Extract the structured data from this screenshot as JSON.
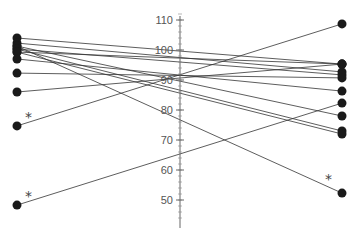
{
  "chart_data": {
    "type": "line",
    "subtype": "slopegraph",
    "title": "",
    "xlabel": "",
    "ylabel": "",
    "ylim": [
      44,
      112
    ],
    "yticks": [
      50,
      60,
      70,
      80,
      90,
      100,
      110
    ],
    "grid": false,
    "legend": null,
    "x": [
      "Left",
      "Right"
    ],
    "series": [
      {
        "name": "s1",
        "values": [
          104,
          95.3
        ],
        "star_left": false,
        "star_right": false
      },
      {
        "name": "s2",
        "values": [
          102.3,
          92.7
        ],
        "star_left": false,
        "star_right": false
      },
      {
        "name": "s3",
        "values": [
          101.3,
          52.3
        ],
        "star_left": false,
        "star_right": true
      },
      {
        "name": "s4",
        "values": [
          101.3,
          78
        ],
        "star_left": false,
        "star_right": false
      },
      {
        "name": "s5",
        "values": [
          100.3,
          91.7
        ],
        "star_left": false,
        "star_right": false
      },
      {
        "name": "s6",
        "values": [
          100.3,
          73
        ],
        "star_left": false,
        "star_right": false
      },
      {
        "name": "s7",
        "values": [
          99.3,
          95.3
        ],
        "star_left": false,
        "star_right": false
      },
      {
        "name": "s8",
        "values": [
          99.3,
          72
        ],
        "star_left": false,
        "star_right": false
      },
      {
        "name": "s9",
        "values": [
          97,
          86.3
        ],
        "star_left": false,
        "star_right": false
      },
      {
        "name": "s10",
        "values": [
          92.3,
          90.7
        ],
        "star_left": false,
        "star_right": false
      },
      {
        "name": "s11",
        "values": [
          86,
          95.3
        ],
        "star_left": false,
        "star_right": false
      },
      {
        "name": "s12",
        "values": [
          74.7,
          108.7
        ],
        "star_left": true,
        "star_right": false
      },
      {
        "name": "s13",
        "values": [
          48.3,
          82.3
        ],
        "star_left": true,
        "star_right": false
      }
    ],
    "annotations": [
      "*",
      "*",
      "*"
    ]
  },
  "axis": {
    "tick_labels": [
      "110",
      "100",
      "90",
      "80",
      "70",
      "60",
      "50"
    ]
  }
}
